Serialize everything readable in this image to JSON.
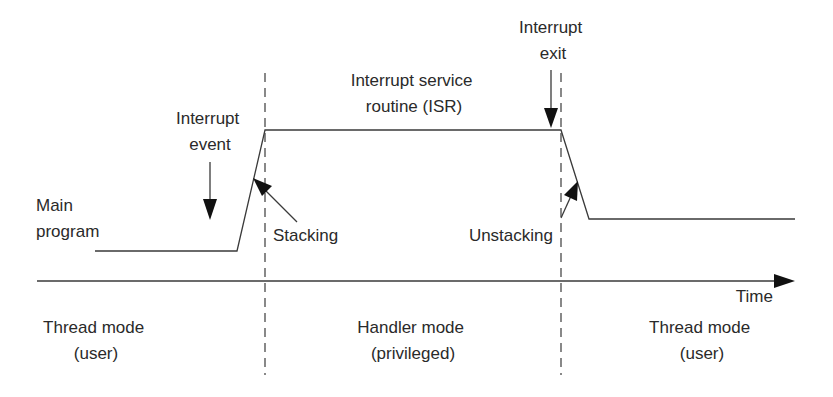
{
  "diagram": {
    "colors": {
      "background": "#ffffff",
      "line": "#3a3a3a",
      "text": "#2a2a2a",
      "arrowhead": "#111111"
    },
    "labels": {
      "main_program": [
        "Main",
        "program"
      ],
      "interrupt_event": [
        "Interrupt",
        "event"
      ],
      "isr": [
        "Interrupt service",
        "routine (ISR)"
      ],
      "interrupt_exit": [
        "Interrupt",
        "exit"
      ],
      "stacking": "Stacking",
      "unstacking": "Unstacking",
      "time_axis": "Time"
    },
    "modes": [
      {
        "name": "Thread mode",
        "privilege": "(user)"
      },
      {
        "name": "Handler mode",
        "privilege": "(privileged)"
      },
      {
        "name": "Thread mode",
        "privilege": "(user)"
      }
    ],
    "phases": [
      {
        "phase": "Main program",
        "level": "low",
        "x_start": 95,
        "x_end": 237
      },
      {
        "phase": "Stacking",
        "transition": "rise",
        "x_start": 237,
        "x_end": 265
      },
      {
        "phase": "Interrupt service routine (ISR)",
        "level": "high",
        "x_start": 265,
        "x_end": 561
      },
      {
        "phase": "Unstacking",
        "transition": "fall",
        "x_start": 561,
        "x_end": 589
      },
      {
        "phase": "Main program (resumed)",
        "level": "mid",
        "x_start": 589,
        "x_end": 795
      }
    ],
    "boundaries": [
      {
        "name": "Interrupt entry boundary",
        "x": 265
      },
      {
        "name": "Interrupt exit boundary",
        "x": 561
      }
    ]
  }
}
